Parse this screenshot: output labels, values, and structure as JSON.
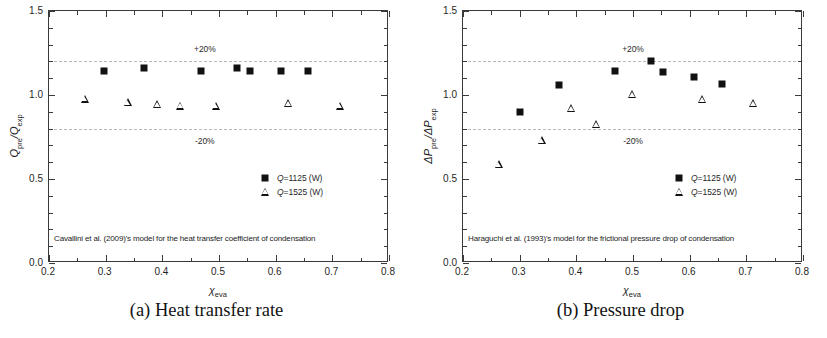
{
  "figure": {
    "background": "#ffffff",
    "marker_color": "#111111",
    "axis_color": "#3a3a3a",
    "refline_color": "#b9b9bd"
  },
  "panels": [
    {
      "id": "a",
      "caption": "(a) Heat transfer rate",
      "model_note": "Cavallini et al. (2009)'s model for the heat transfer coefficient of condensation",
      "y_axis_title_main": "Q",
      "y_axis_title_num_sub": "pre",
      "y_axis_title_den": "Q",
      "y_axis_title_den_sub": "exp",
      "chart_data": {
        "type": "scatter",
        "title": "(a) Heat transfer rate",
        "xlabel": "x_eva",
        "ylabel": "Q_pre/Q_exp",
        "xlim": [
          0.2,
          0.8
        ],
        "ylim": [
          0.0,
          1.5
        ],
        "xticks": [
          0.2,
          0.3,
          0.4,
          0.5,
          0.6,
          0.7,
          0.8
        ],
        "xtick_labels": [
          "0.2",
          "0.3",
          "0.4",
          "0.5",
          "0.6",
          "0.7",
          "0.8"
        ],
        "yticks": [
          0.0,
          0.5,
          1.0,
          1.5
        ],
        "ytick_labels": [
          "0.0",
          "0.5",
          "1.0",
          "1.5"
        ],
        "x_minor_step": 0.05,
        "y_minor_step": 0.1,
        "grid": false,
        "reference_lines": [
          {
            "y": 1.2,
            "label": "+20%",
            "label_x": 0.475,
            "label_dy": 12,
            "style": "dashed"
          },
          {
            "y": 0.8,
            "label": "-20%",
            "label_x": 0.475,
            "label_dy": -12,
            "style": "dashed"
          }
        ],
        "legend_position": "lower right",
        "series": [
          {
            "name": "Q=1125 (W)",
            "marker": "square",
            "points": [
              {
                "x": 0.297,
                "y": 1.145
              },
              {
                "x": 0.367,
                "y": 1.163
              },
              {
                "x": 0.468,
                "y": 1.143
              },
              {
                "x": 0.531,
                "y": 1.163
              },
              {
                "x": 0.554,
                "y": 1.143
              },
              {
                "x": 0.609,
                "y": 1.141
              },
              {
                "x": 0.657,
                "y": 1.143
              }
            ]
          },
          {
            "name": "Q=1525 (W)",
            "marker": "triangle",
            "points": [
              {
                "x": 0.263,
                "y": 0.978
              },
              {
                "x": 0.339,
                "y": 0.958
              },
              {
                "x": 0.391,
                "y": 0.947
              },
              {
                "x": 0.432,
                "y": 0.937
              },
              {
                "x": 0.494,
                "y": 0.937
              },
              {
                "x": 0.622,
                "y": 0.952
              },
              {
                "x": 0.713,
                "y": 0.937
              }
            ]
          }
        ]
      }
    },
    {
      "id": "b",
      "caption": "(b) Pressure drop",
      "model_note": "Haraguchi et al. (1993)'s model for the frictional pressure drop of condensation",
      "y_axis_title_main": "ΔP",
      "y_axis_title_num_sub": "pre",
      "y_axis_title_den": "ΔP",
      "y_axis_title_den_sub": "exp",
      "chart_data": {
        "type": "scatter",
        "title": "(b) Pressure drop",
        "xlabel": "x_eva",
        "ylabel": "ΔP_pre/ΔP_exp",
        "xlim": [
          0.2,
          0.8
        ],
        "ylim": [
          0.0,
          1.5
        ],
        "xticks": [
          0.2,
          0.3,
          0.4,
          0.5,
          0.6,
          0.7,
          0.8
        ],
        "xtick_labels": [
          "0.2",
          "0.3",
          "0.4",
          "0.5",
          "0.6",
          "0.7",
          "0.8"
        ],
        "yticks": [
          0.0,
          0.5,
          1.0,
          1.5
        ],
        "ytick_labels": [
          "0.0",
          "0.5",
          "1.0",
          "1.5"
        ],
        "x_minor_step": 0.05,
        "y_minor_step": 0.1,
        "grid": false,
        "reference_lines": [
          {
            "y": 1.2,
            "label": "+20%",
            "label_x": 0.5,
            "label_dy": 12,
            "style": "dashed"
          },
          {
            "y": 0.8,
            "label": "-20%",
            "label_x": 0.5,
            "label_dy": -12,
            "style": "dashed"
          }
        ],
        "legend_position": "lower right",
        "series": [
          {
            "name": "Q=1125 (W)",
            "marker": "square",
            "points": [
              {
                "x": 0.3,
                "y": 0.9
              },
              {
                "x": 0.369,
                "y": 1.06
              },
              {
                "x": 0.468,
                "y": 1.145
              },
              {
                "x": 0.531,
                "y": 1.205
              },
              {
                "x": 0.553,
                "y": 1.138
              },
              {
                "x": 0.607,
                "y": 1.11
              },
              {
                "x": 0.657,
                "y": 1.063
              }
            ]
          },
          {
            "name": "Q=1525 (W)",
            "marker": "triangle",
            "points": [
              {
                "x": 0.263,
                "y": 0.588
              },
              {
                "x": 0.339,
                "y": 0.73
              },
              {
                "x": 0.391,
                "y": 0.92
              },
              {
                "x": 0.435,
                "y": 0.828
              },
              {
                "x": 0.499,
                "y": 1.005
              },
              {
                "x": 0.622,
                "y": 0.975
              },
              {
                "x": 0.712,
                "y": 0.95
              }
            ]
          }
        ]
      }
    }
  ],
  "legend_entries": [
    {
      "marker": "square",
      "label_prefix": "Q",
      "label_rest": "=1125 (W)"
    },
    {
      "marker": "triangle",
      "label_prefix": "Q",
      "label_rest": "=1525 (W)"
    }
  ],
  "x_axis_symbol": "χ",
  "x_axis_subscript": "eva"
}
